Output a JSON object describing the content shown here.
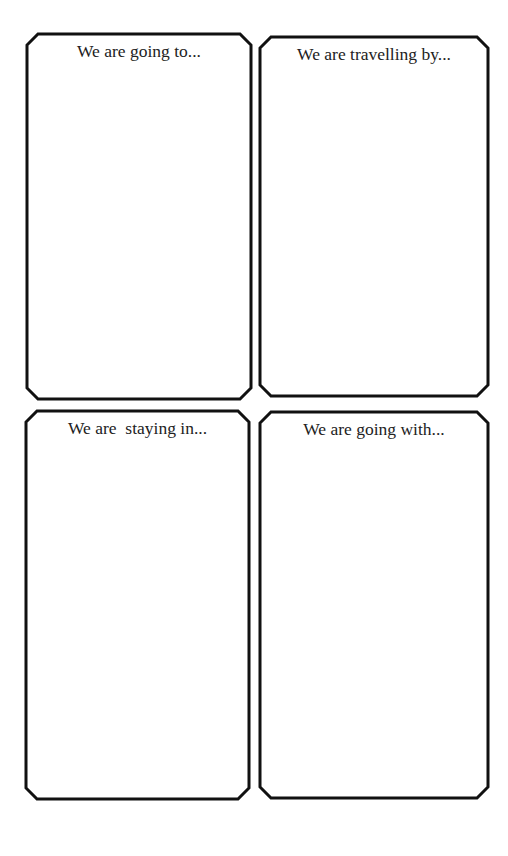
{
  "page": {
    "background": "#ffffff",
    "border_color": "#111111",
    "text_color": "#222222"
  },
  "cards": [
    {
      "id": "destination",
      "prompt": "We are going to...",
      "x": 27,
      "y": 34,
      "w": 224,
      "h": 365
    },
    {
      "id": "transport",
      "prompt": "We are travelling by...",
      "x": 260,
      "y": 37,
      "w": 228,
      "h": 359
    },
    {
      "id": "accommodation",
      "prompt": "We are  staying in...",
      "x": 26,
      "y": 411,
      "w": 223,
      "h": 388
    },
    {
      "id": "companions",
      "prompt": "We are going with...",
      "x": 260,
      "y": 412,
      "w": 228,
      "h": 386
    }
  ]
}
